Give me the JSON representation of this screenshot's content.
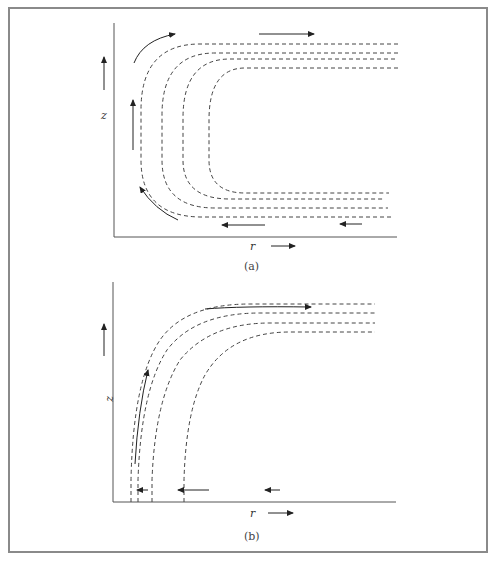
{
  "figure": {
    "panels": [
      {
        "id": "a",
        "caption": "(a)",
        "axis_labels": {
          "vertical": "z",
          "horizontal": "r"
        },
        "description": "Streamlines turning from inward radial flow near the bottom, rising along the axis, and flowing outward at the top"
      },
      {
        "id": "b",
        "caption": "(b)",
        "axis_labels": {
          "vertical": "z",
          "horizontal": "r"
        },
        "description": "Streamlines with inward flow near the bottom turning upward and outward toward the top"
      }
    ],
    "colors": {
      "line": "#333333",
      "frame": "#8a8a8a",
      "axis": "#555555"
    }
  }
}
